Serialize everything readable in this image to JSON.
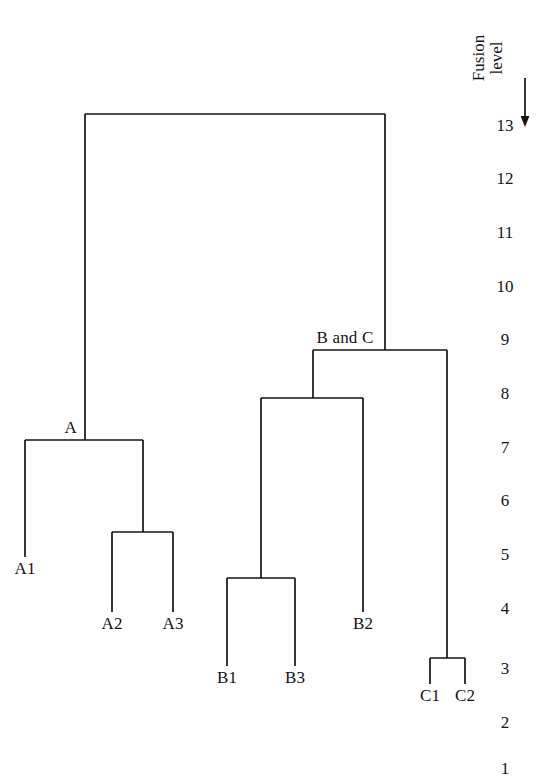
{
  "figure": {
    "type": "dendrogram",
    "background_color": "#ffffff",
    "line_color": "#141414"
  },
  "axis": {
    "title_line1": "Fusion",
    "title_line2": "level",
    "arrow_direction": "down",
    "arrow_name": "axis-direction-arrow",
    "tick_labels": [
      "13",
      "12",
      "11",
      "10",
      "9",
      "8",
      "7",
      "6",
      "5",
      "4",
      "3",
      "2",
      "1"
    ],
    "tick_values": [
      13,
      12,
      11,
      10,
      9,
      8,
      7,
      6,
      5,
      4,
      3,
      2,
      1
    ],
    "tick_y": [
      125,
      178,
      232,
      286,
      339,
      393,
      447,
      500,
      554,
      608,
      668,
      722,
      768
    ],
    "tick_x": 505,
    "range_top": 13,
    "range_bottom": 1
  },
  "chart_data": {
    "type": "dendrogram",
    "title": "",
    "xlabel": "",
    "ylabel": "Fusion level",
    "ylim": [
      1,
      13
    ],
    "y_inverted": true,
    "grid": false,
    "legend": "none",
    "leaves": [
      {
        "label": "A1",
        "x": 25,
        "cluster": "A"
      },
      {
        "label": "A2",
        "x": 112,
        "cluster": "A"
      },
      {
        "label": "A3",
        "x": 173,
        "cluster": "A"
      },
      {
        "label": "B1",
        "x": 227,
        "cluster": "B"
      },
      {
        "label": "B3",
        "x": 295,
        "cluster": "B"
      },
      {
        "label": "B2",
        "x": 363,
        "cluster": "B"
      },
      {
        "label": "C1",
        "x": 430,
        "cluster": "C"
      },
      {
        "label": "C2",
        "x": 465,
        "cluster": "C"
      }
    ],
    "merges": [
      {
        "name": "C1-C2",
        "members": [
          "C1",
          "C2"
        ],
        "fusion_level": 3.0,
        "y": 658,
        "x_left": 430,
        "x_right": 465,
        "stem_x": 447
      },
      {
        "name": "B1-B3",
        "members": [
          "B1",
          "B3"
        ],
        "fusion_level": 4.7,
        "y": 578,
        "x_left": 227,
        "x_right": 295,
        "stem_x": 261
      },
      {
        "name": "A2-A3",
        "members": [
          "A2",
          "A3"
        ],
        "fusion_level": 5.4,
        "y": 532,
        "x_left": 112,
        "x_right": 173,
        "stem_x": 143
      },
      {
        "name": "A",
        "members": [
          "A1",
          "A2-A3"
        ],
        "fusion_level": 7.1,
        "y": 440,
        "x_left": 25,
        "x_right": 143,
        "stem_x": 85
      },
      {
        "name": "B",
        "members": [
          "B1-B3",
          "B2"
        ],
        "fusion_level": 8.0,
        "y": 398,
        "x_left": 261,
        "x_right": 363,
        "stem_x": 313
      },
      {
        "name": "B and C",
        "members": [
          "B",
          "C1-C2"
        ],
        "fusion_level": 9.0,
        "y": 350,
        "x_left": 313,
        "x_right": 447,
        "stem_x": 385
      },
      {
        "name": "root",
        "members": [
          "A",
          "B and C"
        ],
        "fusion_level": 13.0,
        "y": 114,
        "x_left": 85,
        "x_right": 385,
        "stem_x": 235
      }
    ],
    "node_labels": [
      {
        "text": "A",
        "x": 77,
        "y": 432,
        "anchor": "right-of-stem"
      },
      {
        "text": "B and C",
        "x": 345,
        "y": 342,
        "anchor": "centered-above-bar"
      }
    ],
    "leaf_label_positions": [
      {
        "text": "A1",
        "x": 25,
        "y": 573
      },
      {
        "text": "A2",
        "x": 112,
        "y": 628
      },
      {
        "text": "A3",
        "x": 173,
        "y": 628
      },
      {
        "text": "B1",
        "x": 227,
        "y": 682
      },
      {
        "text": "B3",
        "x": 295,
        "y": 682
      },
      {
        "text": "B2",
        "x": 363,
        "y": 628
      },
      {
        "text": "C1",
        "x": 430,
        "y": 700
      },
      {
        "text": "C2",
        "x": 465,
        "y": 700
      }
    ]
  }
}
